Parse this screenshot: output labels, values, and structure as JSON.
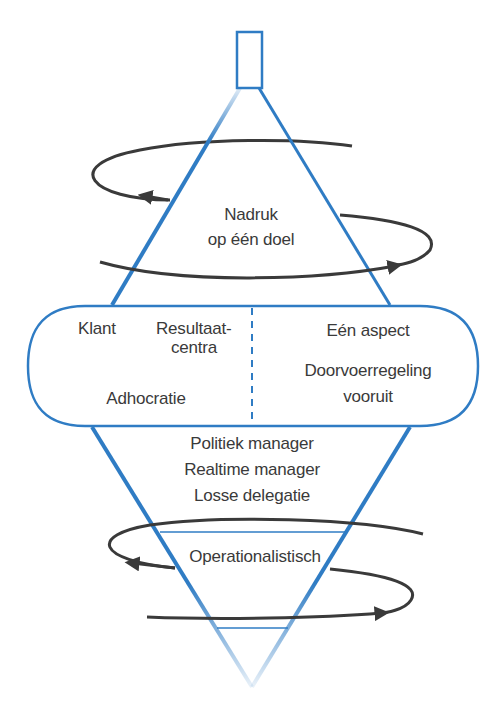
{
  "colors": {
    "blue": "#2f7cc4",
    "loop": "#3a3a3a",
    "text": "#3a3a3a",
    "background": "#ffffff"
  },
  "top_section": {
    "label_line1": "Nadruk",
    "label_line2": "op één doel"
  },
  "capsule": {
    "left": {
      "label_klant": "Klant",
      "label_resultaat_line1": "Resultaat-",
      "label_resultaat_line2": "centra",
      "label_adhocratie": "Adhocratie"
    },
    "right": {
      "label_aspect": "Eén aspect",
      "label_doorvoer_line1": "Doorvoerregeling",
      "label_doorvoer_line2": "vooruit"
    }
  },
  "middle_section": {
    "lines": [
      "Politiek manager",
      "Realtime manager",
      "Losse delegatie"
    ]
  },
  "bottom_section": {
    "label": "Operationalistisch"
  }
}
